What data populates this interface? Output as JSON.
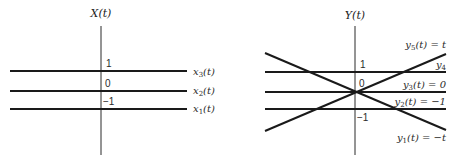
{
  "left_plot": {
    "title": "X(t)",
    "ticks": [
      "1",
      "0",
      "−1"
    ],
    "lines": [
      {
        "name": "x3",
        "label_base": "x",
        "label_sub": "3",
        "label_rest": "(t)",
        "value": 1
      },
      {
        "name": "x2",
        "label_base": "x",
        "label_sub": "2",
        "label_rest": "(t)",
        "value": 0
      },
      {
        "name": "x1",
        "label_base": "x",
        "label_sub": "1",
        "label_rest": "(t)",
        "value": -1
      }
    ]
  },
  "right_plot": {
    "title": "Y(t)",
    "ticks": [
      "1",
      "0",
      "−1"
    ],
    "lines": [
      {
        "name": "y5",
        "label_base": "y",
        "label_sub": "5",
        "label_rest": "(t) = t",
        "expr": "t"
      },
      {
        "name": "y4",
        "label_base": "y",
        "label_sub": "4",
        "label_rest": "",
        "expr": "1"
      },
      {
        "name": "y3",
        "label_base": "y",
        "label_sub": "3",
        "label_rest": "(t) = 0",
        "expr": "0"
      },
      {
        "name": "y2",
        "label_base": "y",
        "label_sub": "2",
        "label_rest": "(t) = −1",
        "expr": "-1"
      },
      {
        "name": "y1",
        "label_base": "y",
        "label_sub": "1",
        "label_rest": "(t) = −t",
        "expr": "-t"
      }
    ]
  },
  "colors": {
    "line": "#1a1a1a",
    "background": "#ffffff"
  }
}
